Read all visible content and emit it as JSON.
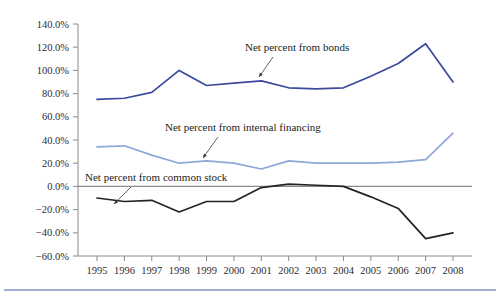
{
  "chart_data": {
    "type": "line",
    "title": "",
    "xlabel": "",
    "ylabel": "",
    "x": [
      1995,
      1996,
      1997,
      1998,
      1999,
      2000,
      2001,
      2002,
      2003,
      2004,
      2005,
      2006,
      2007,
      2008
    ],
    "categories": [
      "1995",
      "1996",
      "1997",
      "1998",
      "1999",
      "2000",
      "2001",
      "2002",
      "2003",
      "2004",
      "2005",
      "2006",
      "2007",
      "2008"
    ],
    "ylim": [
      -60,
      140
    ],
    "ytick_values": [
      140,
      120,
      100,
      80,
      60,
      40,
      20,
      0,
      -20,
      -40,
      -60
    ],
    "ytick_labels": [
      "140.0%",
      "120.0%",
      "100.0%",
      "80.0%",
      "60.0%",
      "40.0%",
      "20.0%",
      "0.0%",
      "-20.0%",
      "-40.0%",
      "-60.0%"
    ],
    "grid": false,
    "legend_position": "inline-annotations",
    "series": [
      {
        "name": "Net percent from bonds",
        "color": "#3b4a9c",
        "values": [
          75,
          76,
          81,
          100,
          87,
          89,
          91,
          85,
          84,
          85,
          95,
          106,
          123,
          90
        ]
      },
      {
        "name": "Net percent from internal financing",
        "color": "#8fa6da",
        "values": [
          34,
          35,
          27,
          20,
          22,
          20,
          15,
          22,
          20,
          20,
          20,
          21,
          23,
          46
        ]
      },
      {
        "name": "Net percent from common stock",
        "color": "#23232a",
        "values": [
          -10,
          -13,
          -12,
          -22,
          -13,
          -13,
          -1,
          2,
          1,
          0,
          -9,
          -19,
          -45,
          -40
        ]
      }
    ],
    "annotations": [
      {
        "text": "Net percent from bonds",
        "series": "Net percent from bonds",
        "label_x": 245,
        "label_y": 51,
        "leader_from_x": 273,
        "leader_from_y": 57,
        "leader_to_x": 259,
        "leader_to_y": 77
      },
      {
        "text": "Net percent from internal financing",
        "series": "Net percent from internal financing",
        "label_x": 165,
        "label_y": 131,
        "leader_from_x": 218,
        "leader_from_y": 137,
        "leader_to_x": 203,
        "leader_to_y": 158
      },
      {
        "text": "Net percent from common stock",
        "series": "Net percent from common stock",
        "label_x": 85,
        "label_y": 181,
        "leader_from_x": 131,
        "leader_from_y": 187,
        "leader_to_x": 114,
        "leader_to_y": 204
      }
    ]
  },
  "colors": {
    "bonds": "#3b4a9c",
    "internal_financing": "#8fa6da",
    "common_stock": "#23232a",
    "axis": "#8a8a8a",
    "bottom_rule": "#4a5fa8",
    "background": "#ffffff"
  },
  "footer": {
    "rule_label": "bottom-divider"
  }
}
